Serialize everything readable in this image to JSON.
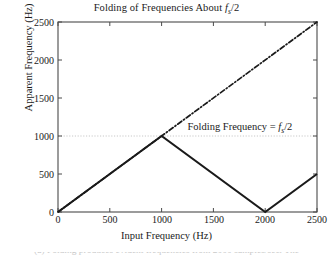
{
  "figure": {
    "title_prefix": "Folding of Frequencies About ",
    "title_var": "f",
    "title_sub": "s",
    "title_suffix": "/2",
    "background_color": "#ffffff",
    "line_color": "#1a1a1a",
    "grid_color": "#c8c8c8"
  },
  "axes": {
    "xlabel": "Input Frequency  (Hz)",
    "ylabel": "Apparent Frequency  (Hz)",
    "xticks": [
      "0",
      "500",
      "1000",
      "1500",
      "2000",
      "2500"
    ],
    "yticks": [
      "0",
      "500",
      "1000",
      "1500",
      "2000",
      "2500"
    ]
  },
  "annotation": {
    "prefix": "Folding Frequency = ",
    "var": "f",
    "sub": "s",
    "suffix": "/2"
  },
  "caption": {
    "text": "(a)  Folding produces evident frequencies from 2000 samples/sec.  The"
  },
  "chart_data": {
    "type": "line",
    "title": "Folding of Frequencies About fs/2",
    "xlabel": "Input Frequency  (Hz)",
    "ylabel": "Apparent Frequency  (Hz)",
    "xlim": [
      0,
      2500
    ],
    "ylim": [
      0,
      2500
    ],
    "xticks": [
      0,
      500,
      1000,
      1500,
      2000,
      2500
    ],
    "yticks": [
      0,
      500,
      1000,
      1500,
      2000,
      2500
    ],
    "grid": false,
    "legend": "none",
    "series": [
      {
        "name": "Apparent (folded) frequency",
        "style": "solid",
        "linewidth": 2,
        "color": "#1a1a1a",
        "x": [
          0,
          1000,
          2000,
          2500
        ],
        "y": [
          0,
          1000,
          0,
          500
        ]
      },
      {
        "name": "Ideal (unfolded) frequency",
        "style": "dashdot",
        "linewidth": 1.6,
        "color": "#1a1a1a",
        "x": [
          0,
          2500
        ],
        "y": [
          0,
          2500
        ]
      },
      {
        "name": "Folding frequency level",
        "style": "dotted",
        "linewidth": 1,
        "color": "#c8c8c8",
        "x": [
          0,
          2500
        ],
        "y": [
          1000,
          1000
        ]
      }
    ],
    "annotations": [
      {
        "text": "Folding Frequency = fs/2",
        "x": 1250,
        "y": 1120
      }
    ]
  }
}
